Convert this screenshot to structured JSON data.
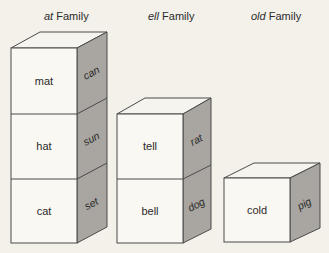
{
  "families": [
    {
      "title_italic": "at",
      "title_rest": " Family",
      "blocks": [
        {
          "front": "mat",
          "side": "can"
        },
        {
          "front": "hat",
          "side": "sun"
        },
        {
          "front": "cat",
          "side": "set"
        }
      ]
    },
    {
      "title_italic": "ell",
      "title_rest": " Family",
      "blocks": [
        {
          "front": "tell",
          "side": "rat"
        },
        {
          "front": "bell",
          "side": "dog"
        }
      ]
    },
    {
      "title_italic": "old",
      "title_rest": " Family",
      "blocks": [
        {
          "front": "cold",
          "side": "pig"
        }
      ]
    }
  ],
  "colors": {
    "background": "#f3f1ea",
    "front_face": "#faf8f3",
    "side_face": "#a9a6a1",
    "outline": "#4a4a4a"
  }
}
